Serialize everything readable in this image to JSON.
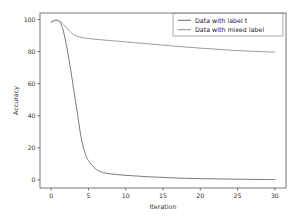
{
  "chart_data": {
    "type": "line",
    "title": "",
    "xlabel": "Iteration",
    "ylabel": "Accuracy",
    "xlim": [
      -1.5,
      31.5
    ],
    "ylim": [
      -5,
      104
    ],
    "xticks": [
      0,
      5,
      10,
      15,
      20,
      25,
      30
    ],
    "yticks": [
      0,
      20,
      40,
      60,
      80,
      100
    ],
    "xticklabels": [
      "0",
      "5",
      "10",
      "15",
      "20",
      "25",
      "30"
    ],
    "yticklabels": [
      "0",
      "20",
      "40",
      "60",
      "80",
      "100"
    ],
    "grid": false,
    "legend_position": "upper right",
    "x": [
      0,
      0.5,
      1,
      1.5,
      2,
      2.5,
      3,
      3.5,
      4,
      4.5,
      5,
      6,
      7,
      8,
      9,
      10,
      11,
      12,
      13,
      14,
      15,
      16,
      17,
      18,
      19,
      20,
      21,
      22,
      23,
      24,
      25,
      26,
      27,
      28,
      29,
      30
    ],
    "series": [
      {
        "name": "Data with label t",
        "color": "#6b6b6b",
        "values": [
          98.3,
          99.4,
          99.1,
          95.0,
          85.0,
          72.0,
          57.0,
          42.0,
          27.0,
          17.5,
          12.0,
          6.8,
          4.6,
          3.8,
          3.3,
          2.9,
          2.6,
          2.3,
          2.0,
          1.8,
          1.6,
          1.4,
          1.2,
          1.05,
          0.95,
          0.85,
          0.75,
          0.68,
          0.6,
          0.53,
          0.47,
          0.42,
          0.37,
          0.32,
          0.28,
          0.25
        ]
      },
      {
        "name": "Data with mixed label",
        "color": "#8e8e8e",
        "values": [
          98.3,
          99.4,
          99.2,
          97.6,
          95.2,
          92.6,
          90.6,
          89.5,
          88.8,
          88.4,
          88.1,
          87.6,
          87.2,
          86.8,
          86.4,
          86.0,
          85.6,
          85.2,
          84.8,
          84.4,
          84.0,
          83.6,
          83.2,
          82.8,
          82.5,
          82.1,
          81.8,
          81.5,
          81.2,
          80.9,
          80.6,
          80.4,
          80.2,
          80.0,
          79.8,
          79.6
        ]
      }
    ],
    "frame": {
      "left": 40,
      "right": 286,
      "top": 13,
      "bottom": 188,
      "color": "#555555"
    },
    "legend": {
      "x": 173,
      "y": 13.5,
      "width": 110,
      "height": 22.5
    }
  }
}
